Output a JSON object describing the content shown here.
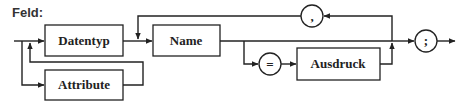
{
  "diagram": {
    "title": "Feld:",
    "nonterminals": {
      "datentyp": "Datentyp",
      "attribute": "Attribute",
      "name": "Name",
      "ausdruck": "Ausdruck"
    },
    "terminals": {
      "comma": ",",
      "equals": "=",
      "semicolon": ";"
    },
    "colors": {
      "line": "#222222",
      "background": "#ffffff"
    }
  }
}
